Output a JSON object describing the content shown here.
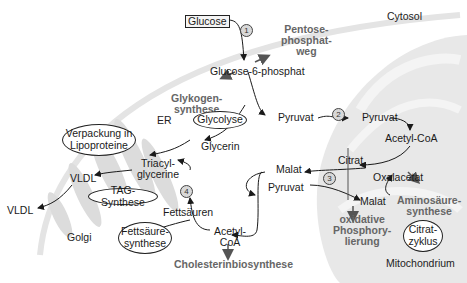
{
  "diagram": {
    "regions": {
      "cytosol": "Cytosol",
      "mitochondrium": "Mitochondrium",
      "er": "ER",
      "golgi": "Golgi"
    },
    "metabolites": {
      "glucose": "Glucose",
      "glucose6p": "Glucose-6-phosphat",
      "pyruvat_cyto": "Pyruvat",
      "pyruvat_mito": "Pyruvat",
      "acetylcoa_mito": "Acetyl-CoA",
      "citrat": "Citrat",
      "oxalacetat": "Oxalacetat",
      "malat_mito": "Malat",
      "malat_cyto": "Malat",
      "pyruvat_cyto2": "Pyruvat",
      "acetylcoa_cyto_1": "Acetyl-",
      "acetylcoa_cyto_2": "CoA",
      "fettsaeuren": "Fettsäuren",
      "triacyl_1": "Triacyl-",
      "triacyl_2": "glycerine",
      "glycerin": "Glycerin",
      "vldl_golgi": "VLDL",
      "vldl_out": "VLDL"
    },
    "pathways": {
      "pentose_1": "Pentose-",
      "pentose_2": "phosphat-",
      "pentose_3": "weg",
      "glykogen_1": "Glykogen-",
      "glykogen_2": "synthese",
      "cholesterin": "Cholesterinbiosynthese",
      "oxphos_1": "oxidative",
      "oxphos_2": "Phosphory-",
      "oxphos_3": "lierung",
      "amino_1": "Aminosäure-",
      "amino_2": "synthese"
    },
    "bubbles": {
      "glycolyse": "Glycolyse",
      "verpackung_1": "Verpackung in",
      "verpackung_2": "Lipoproteine",
      "tag": "TAG-Synthese",
      "fettsaeure_1": "Fettsäure-",
      "fettsaeure_2": "synthese",
      "citrat_1": "Citrat-",
      "citrat_2": "zyklus"
    },
    "step_numbers": [
      "1",
      "2",
      "3",
      "4"
    ],
    "colors": {
      "mitochondrion_fill": "#e6e6e6",
      "organelle_fill": "#d9d9d9",
      "membrane": "#e2e2e2",
      "arrow": "#1a1a1a",
      "pathway_text": "#666666"
    }
  }
}
